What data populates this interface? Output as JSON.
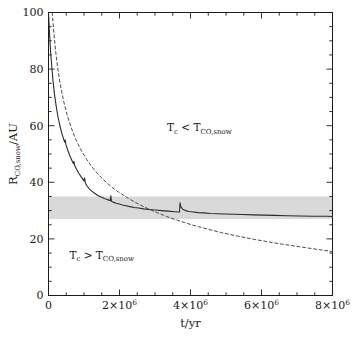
{
  "chart_data": {
    "type": "line",
    "title": "",
    "xlabel": "t/yr",
    "ylabel": "R_CO,snow/AU",
    "xlim": [
      0,
      8000000
    ],
    "ylim": [
      0,
      100
    ],
    "grid": false,
    "legend": "none",
    "x_tick_values": [
      0,
      2000000,
      4000000,
      6000000,
      8000000
    ],
    "x_tick_labels": [
      "0",
      "2×10⁶",
      "4×10⁶",
      "6×10⁶",
      "8×10⁶"
    ],
    "x_minor_step": 500000,
    "y_tick_values": [
      0,
      20,
      40,
      60,
      80,
      100
    ],
    "y_tick_labels": [
      "0",
      "20",
      "40",
      "60",
      "80",
      "100"
    ],
    "y_minor_step": 5,
    "shaded_band": {
      "label": "CO snowline observational range",
      "y_min": 27,
      "y_max": 35,
      "color": "#d9d9d9"
    },
    "annotations": [
      {
        "name": "upper-region-label",
        "text": "T_c < T_CO,snow",
        "main1": "T",
        "sub1": "c",
        "relation": "<",
        "main2": "T",
        "sub2": "CO,snow",
        "x": 4250000,
        "y": 58
      },
      {
        "name": "lower-region-label",
        "text": "T_c > T_CO,snow",
        "main1": "T",
        "sub1": "c",
        "relation": ">",
        "main2": "T",
        "sub2": "CO,snow",
        "x": 1500000,
        "y": 13
      }
    ],
    "series": [
      {
        "name": "model-snowline-solid",
        "style": "solid",
        "color": "#2b2b2b",
        "width": 1.1,
        "points": [
          [
            0,
            100
          ],
          [
            30000,
            92.5
          ],
          [
            60000,
            86.0
          ],
          [
            95000,
            80.5
          ],
          [
            130000,
            75.5
          ],
          [
            170000,
            71.0
          ],
          [
            215000,
            67.0
          ],
          [
            260000,
            63.6
          ],
          [
            310000,
            60.6
          ],
          [
            360000,
            58.0
          ],
          [
            415000,
            55.7
          ],
          [
            455000,
            54.2
          ],
          [
            470000,
            55.0
          ],
          [
            490000,
            53.4
          ],
          [
            540000,
            51.4
          ],
          [
            600000,
            49.4
          ],
          [
            660000,
            47.7
          ],
          [
            700000,
            46.6
          ],
          [
            715000,
            47.4
          ],
          [
            735000,
            46.0
          ],
          [
            790000,
            44.6
          ],
          [
            850000,
            43.3
          ],
          [
            910000,
            42.1
          ],
          [
            960000,
            41.2
          ],
          [
            1000000,
            40.5
          ],
          [
            1015000,
            41.6
          ],
          [
            1040000,
            39.6
          ],
          [
            1090000,
            38.6
          ],
          [
            1150000,
            37.7
          ],
          [
            1220000,
            36.9
          ],
          [
            1290000,
            36.2
          ],
          [
            1360000,
            35.6
          ],
          [
            1430000,
            35.1
          ],
          [
            1500000,
            34.7
          ],
          [
            1570000,
            34.3
          ],
          [
            1640000,
            34.0
          ],
          [
            1700000,
            33.7
          ],
          [
            1740000,
            33.5
          ],
          [
            1755000,
            35.2
          ],
          [
            1775000,
            33.3
          ],
          [
            1840000,
            32.9
          ],
          [
            1910000,
            32.6
          ],
          [
            1990000,
            32.3
          ],
          [
            2080000,
            32.0
          ],
          [
            2180000,
            31.7
          ],
          [
            2290000,
            31.4
          ],
          [
            2410000,
            31.1
          ],
          [
            2540000,
            30.9
          ],
          [
            2680000,
            30.6
          ],
          [
            2830000,
            30.4
          ],
          [
            3000000,
            30.2
          ],
          [
            3180000,
            30.0
          ],
          [
            3370000,
            29.8
          ],
          [
            3550000,
            29.6
          ],
          [
            3660000,
            29.5
          ],
          [
            3690000,
            29.5
          ],
          [
            3705000,
            32.8
          ],
          [
            3725000,
            31.4
          ],
          [
            3780000,
            30.5
          ],
          [
            3860000,
            30.0
          ],
          [
            3960000,
            29.7
          ],
          [
            4080000,
            29.5
          ],
          [
            4220000,
            29.3
          ],
          [
            4380000,
            29.2
          ],
          [
            4560000,
            29.0
          ],
          [
            4760000,
            28.9
          ],
          [
            4980000,
            28.8
          ],
          [
            5220000,
            28.7
          ],
          [
            5480000,
            28.6
          ],
          [
            5760000,
            28.5
          ],
          [
            6060000,
            28.4
          ],
          [
            6380000,
            28.3
          ],
          [
            6720000,
            28.2
          ],
          [
            7080000,
            28.1
          ],
          [
            7460000,
            28.0
          ],
          [
            7860000,
            28.0
          ],
          [
            8000000,
            27.9
          ]
        ]
      },
      {
        "name": "comparison-snowline-dashed",
        "style": "dashed",
        "color": "#4a4a4a",
        "width": 1.0,
        "points": [
          [
            105000,
            100
          ],
          [
            150000,
            93.0
          ],
          [
            200000,
            86.5
          ],
          [
            255000,
            80.8
          ],
          [
            315000,
            75.8
          ],
          [
            380000,
            71.4
          ],
          [
            450000,
            67.4
          ],
          [
            525000,
            63.8
          ],
          [
            605000,
            60.6
          ],
          [
            690000,
            57.6
          ],
          [
            780000,
            54.9
          ],
          [
            875000,
            52.4
          ],
          [
            975000,
            50.1
          ],
          [
            1080000,
            48.0
          ],
          [
            1190000,
            46.0
          ],
          [
            1305000,
            44.2
          ],
          [
            1425000,
            42.5
          ],
          [
            1550000,
            40.9
          ],
          [
            1680000,
            39.4
          ],
          [
            1815000,
            38.0
          ],
          [
            1955000,
            36.7
          ],
          [
            2100000,
            35.5
          ],
          [
            2250000,
            34.3
          ],
          [
            2405000,
            33.2
          ],
          [
            2565000,
            32.1
          ],
          [
            2730000,
            31.1
          ],
          [
            2900000,
            30.1
          ],
          [
            3075000,
            29.2
          ],
          [
            3255000,
            28.3
          ],
          [
            3440000,
            27.4
          ],
          [
            3630000,
            26.6
          ],
          [
            3825000,
            25.8
          ],
          [
            4025000,
            25.0
          ],
          [
            4230000,
            24.3
          ],
          [
            4440000,
            23.6
          ],
          [
            4655000,
            22.9
          ],
          [
            4875000,
            22.2
          ],
          [
            5100000,
            21.6
          ],
          [
            5330000,
            21.0
          ],
          [
            5565000,
            20.4
          ],
          [
            5805000,
            19.8
          ],
          [
            6050000,
            19.3
          ],
          [
            6300000,
            18.7
          ],
          [
            6555000,
            18.2
          ],
          [
            6815000,
            17.7
          ],
          [
            7080000,
            17.2
          ],
          [
            7350000,
            16.7
          ],
          [
            7625000,
            16.2
          ],
          [
            7905000,
            15.7
          ],
          [
            8000000,
            15.5
          ]
        ]
      }
    ]
  }
}
